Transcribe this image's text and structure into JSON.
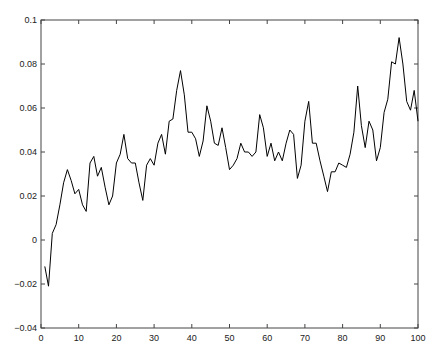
{
  "chart_data": {
    "type": "line",
    "title": "",
    "xlabel": "",
    "ylabel": "",
    "xlim": [
      0,
      100
    ],
    "ylim": [
      -0.04,
      0.1
    ],
    "grid": false,
    "legend": null,
    "x_ticks": [
      "0",
      "10",
      "20",
      "30",
      "40",
      "50",
      "60",
      "70",
      "80",
      "90",
      "100"
    ],
    "y_ticks": [
      "-0.04",
      "-0.02",
      "0",
      "0.02",
      "0.04",
      "0.06",
      "0.08",
      "0.1"
    ],
    "series": [
      {
        "name": "series1",
        "color": "#000000",
        "x": [
          1,
          2,
          3,
          4,
          5,
          6,
          7,
          8,
          9,
          10,
          11,
          12,
          13,
          14,
          15,
          16,
          17,
          18,
          19,
          20,
          21,
          22,
          23,
          24,
          25,
          26,
          27,
          28,
          29,
          30,
          31,
          32,
          33,
          34,
          35,
          36,
          37,
          38,
          39,
          40,
          41,
          42,
          43,
          44,
          45,
          46,
          47,
          48,
          49,
          50,
          51,
          52,
          53,
          54,
          55,
          56,
          57,
          58,
          59,
          60,
          61,
          62,
          63,
          64,
          65,
          66,
          67,
          68,
          69,
          70,
          71,
          72,
          73,
          74,
          75,
          76,
          77,
          78,
          79,
          80,
          81,
          82,
          83,
          84,
          85,
          86,
          87,
          88,
          89,
          90,
          91,
          92,
          93,
          94,
          95,
          96,
          97,
          98,
          99,
          100
        ],
        "values": [
          -0.012,
          -0.021,
          0.003,
          0.007,
          0.016,
          0.026,
          0.032,
          0.027,
          0.021,
          0.023,
          0.016,
          0.013,
          0.035,
          0.038,
          0.029,
          0.033,
          0.024,
          0.016,
          0.02,
          0.035,
          0.039,
          0.048,
          0.037,
          0.035,
          0.035,
          0.026,
          0.018,
          0.034,
          0.037,
          0.034,
          0.044,
          0.048,
          0.039,
          0.054,
          0.055,
          0.068,
          0.077,
          0.066,
          0.049,
          0.049,
          0.046,
          0.038,
          0.045,
          0.061,
          0.054,
          0.044,
          0.043,
          0.051,
          0.042,
          0.032,
          0.034,
          0.037,
          0.044,
          0.04,
          0.04,
          0.038,
          0.04,
          0.057,
          0.051,
          0.038,
          0.044,
          0.036,
          0.04,
          0.036,
          0.044,
          0.05,
          0.048,
          0.028,
          0.034,
          0.054,
          0.063,
          0.044,
          0.044,
          0.036,
          0.029,
          0.022,
          0.031,
          0.031,
          0.035,
          0.034,
          0.033,
          0.039,
          0.049,
          0.07,
          0.052,
          0.042,
          0.054,
          0.05,
          0.036,
          0.042,
          0.058,
          0.064,
          0.081,
          0.08,
          0.092,
          0.08,
          0.063,
          0.059,
          0.068,
          0.054
        ]
      }
    ]
  }
}
